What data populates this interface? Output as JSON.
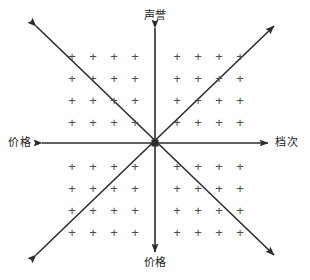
{
  "diagram": {
    "type": "four-quadrant-positioning-map",
    "background_color": "#ffffff",
    "line_color": "#2b2b2b",
    "plus_color": "#4d4d4d",
    "center": {
      "x": 155,
      "y": 143
    },
    "labels": {
      "top": "声誉",
      "bottom": "价格",
      "left": "价格",
      "right": "档次"
    },
    "axes": [
      {
        "name": "vertical-axis",
        "orientation": "vertical",
        "x1": 155,
        "y1": 28,
        "x2": 155,
        "y2": 252,
        "arrow_start": true,
        "arrow_end": true,
        "start_label": "声誉",
        "end_label": "价格"
      },
      {
        "name": "horizontal-axis",
        "orientation": "horizontal",
        "x1": 42,
        "y1": 143,
        "x2": 268,
        "y2": 143,
        "arrow_start": true,
        "arrow_end": true,
        "start_label": "价格",
        "end_label": "档次"
      },
      {
        "name": "diagonal-axis-nwse",
        "orientation": "diagonal",
        "x1": 36,
        "y1": 26,
        "x2": 274,
        "y2": 255,
        "arrow_start": true,
        "arrow_end": true,
        "start_label": "",
        "end_label": ""
      },
      {
        "name": "diagonal-axis-swne",
        "orientation": "diagonal",
        "x1": 36,
        "y1": 255,
        "x2": 274,
        "y2": 26,
        "arrow_start": true,
        "arrow_end": true,
        "start_label": "",
        "end_label": ""
      }
    ],
    "plus_symbol": "+",
    "quadrants": [
      {
        "name": "quadrant-upper-left",
        "rows": 4,
        "cols": 4,
        "x_start": 72,
        "y_start": 56,
        "x_step": 21,
        "y_step": 22
      },
      {
        "name": "quadrant-upper-right",
        "rows": 4,
        "cols": 4,
        "x_start": 177,
        "y_start": 56,
        "x_step": 21,
        "y_step": 22
      },
      {
        "name": "quadrant-lower-left",
        "rows": 4,
        "cols": 4,
        "x_start": 72,
        "y_start": 166,
        "x_step": 21,
        "y_step": 22
      },
      {
        "name": "quadrant-lower-right",
        "rows": 4,
        "cols": 4,
        "x_start": 177,
        "y_start": 166,
        "x_step": 21,
        "y_step": 22
      }
    ]
  }
}
